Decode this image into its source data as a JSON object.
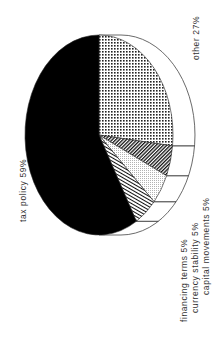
{
  "chart_data": {
    "type": "pie",
    "style": "3d-pie, rotated 90deg counter-clockwise, monochrome patterns",
    "title": "",
    "slices": [
      {
        "label": "tax policy",
        "value": 59,
        "display": "tax policy 59%",
        "pattern": "solid-black"
      },
      {
        "label": "financing terms",
        "value": 5,
        "display": "financing terms 5%",
        "pattern": "diagonal-lines"
      },
      {
        "label": "currency stability",
        "value": 5,
        "display": "currency stability 5%",
        "pattern": "fine-dots"
      },
      {
        "label": "capital movements",
        "value": 5,
        "display": "capital movements 5%",
        "pattern": "dense-hatch"
      },
      {
        "label": "other",
        "value": 27,
        "display": "other 27%",
        "pattern": "grid-dots"
      }
    ],
    "legend": "none (direct labels)",
    "colors": {
      "ink": "#000000",
      "paper": "#ffffff",
      "text": "#333333"
    }
  },
  "labels": {
    "tax_policy": "tax policy 59%",
    "financing_terms": "financing terms 5%",
    "currency_stability": "currency stability 5%",
    "capital_movements": "capital movements 5%",
    "other": "other 27%"
  }
}
